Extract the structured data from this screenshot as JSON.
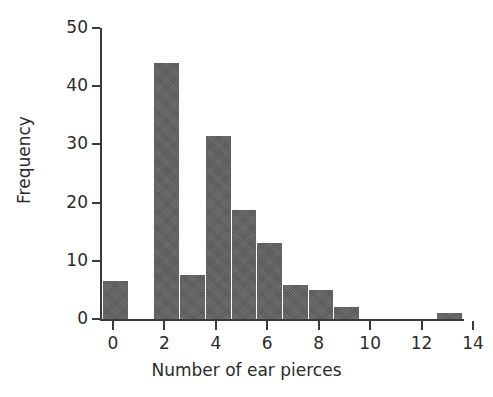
{
  "chart_data": {
    "type": "bar",
    "title": "",
    "xlabel": "Number of ear pierces",
    "ylabel": "Frequency",
    "categories": [
      0,
      1,
      2,
      3,
      4,
      5,
      6,
      7,
      8,
      9,
      10,
      11,
      12,
      13
    ],
    "values": [
      6.5,
      0,
      44,
      7.5,
      31.5,
      18.8,
      13,
      5.8,
      4.9,
      2,
      0,
      0,
      0,
      1
    ],
    "x": [
      0,
      1,
      2,
      3,
      4,
      5,
      6,
      7,
      8,
      9,
      10,
      11,
      12,
      13
    ],
    "xlim": [
      0,
      14
    ],
    "ylim": [
      0,
      50
    ],
    "x_ticks": [
      0,
      2,
      4,
      6,
      8,
      10,
      12,
      14
    ],
    "x_tick_labels": [
      "0",
      "2",
      "4",
      "6",
      "8",
      "10",
      "12",
      "14"
    ],
    "y_ticks": [
      0,
      10,
      20,
      30,
      40,
      50
    ],
    "y_tick_labels": [
      "0",
      "10",
      "20",
      "30",
      "40",
      "50"
    ],
    "grid": false,
    "legend": false,
    "legend_position": "none",
    "bar_color": "#5e5e5e",
    "axis_color": "#3a3a3a",
    "text_color": "#2b2b2b",
    "background_color": "#ffffff",
    "bar_width_units": 1,
    "bar_align": "center"
  }
}
